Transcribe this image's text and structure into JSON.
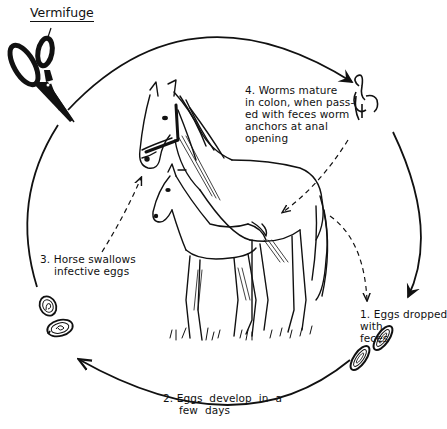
{
  "diagram": {
    "title": "Vermifuge",
    "cycle_direction": "clockwise",
    "stages": [
      {
        "id": 1,
        "text_lines": [
          "1. Eggs  dropped",
          "with",
          "feces"
        ]
      },
      {
        "id": 2,
        "text_lines": [
          "2. Eggs  develop  in  a",
          "few  days"
        ]
      },
      {
        "id": 3,
        "text_lines": [
          "3. Horse  swallows",
          "infective  eggs"
        ]
      },
      {
        "id": 4,
        "text_lines": [
          "4. Worms  mature",
          "in colon, when  pass-",
          "ed with feces worm",
          "anchors  at  anal",
          "opening"
        ]
      }
    ],
    "icons": {
      "vermifuge": "scissors-icon",
      "worm": "worm-icon",
      "eggs_dropped": "egg-icon",
      "eggs_infective": "egg-icon",
      "central": "horse-and-foal-illustration"
    },
    "colors": {
      "ink": "#111111",
      "background": "#ffffff"
    }
  }
}
